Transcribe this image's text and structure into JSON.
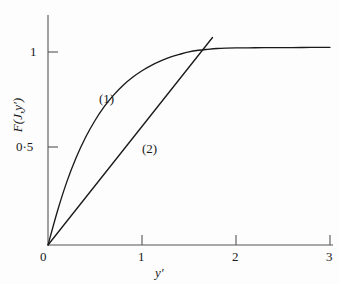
{
  "figure": {
    "background_color": "#fdfdfd",
    "line_color": "#1a1a1a",
    "axis_color": "#555555"
  },
  "axes": {
    "x_title": "y′",
    "y_title": "F(J,y′)",
    "x_ticks": [
      "0",
      "1",
      "2",
      "3"
    ],
    "y_ticks": [
      "0·5",
      "1"
    ]
  },
  "annotations": {
    "curve_one_label": "(1)",
    "curve_two_label": "(2)"
  },
  "chart_data": {
    "type": "line",
    "title": "",
    "xlabel": "y′",
    "ylabel": "F(J,y′)",
    "xlim": [
      0,
      3
    ],
    "ylim": [
      0,
      1.1
    ],
    "xticks": [
      0,
      1,
      2,
      3
    ],
    "xticklabels": [
      "0",
      "1",
      "2",
      "3"
    ],
    "yticks": [
      0.5,
      1
    ],
    "yticklabels": [
      "0·5",
      "1"
    ],
    "grid": false,
    "legend": "none",
    "annotations": [
      {
        "text": "(1)",
        "x": 0.62,
        "y": 0.8,
        "series": "curve-1"
      },
      {
        "text": "(2)",
        "x": 1.08,
        "y": 0.53,
        "series": "curve-2"
      }
    ],
    "series": [
      {
        "name": "(1)",
        "label": "(1)",
        "kind": "saturating-curve",
        "x": [
          0,
          0.1,
          0.2,
          0.3,
          0.4,
          0.5,
          0.6,
          0.7,
          0.8,
          0.9,
          1.0,
          1.1,
          1.2,
          1.3,
          1.4,
          1.5,
          1.6,
          1.7,
          1.8,
          1.9,
          2.0,
          2.2,
          2.4,
          2.6,
          2.8,
          3.0
        ],
        "y": [
          0,
          0.175,
          0.327,
          0.453,
          0.558,
          0.645,
          0.718,
          0.778,
          0.828,
          0.869,
          0.903,
          0.931,
          0.954,
          0.973,
          0.988,
          1.001,
          1.009,
          1.014,
          1.018,
          1.02,
          1.021,
          1.022,
          1.023,
          1.023,
          1.024,
          1.024
        ]
      },
      {
        "name": "(2)",
        "label": "(2)",
        "kind": "straight-line",
        "x": [
          0,
          1.75
        ],
        "y": [
          0,
          1.075
        ]
      }
    ],
    "crossing_point": {
      "x": 1.51,
      "y": 0.915
    }
  }
}
